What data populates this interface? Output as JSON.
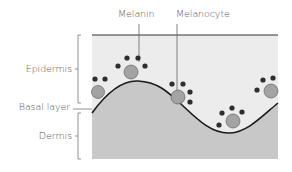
{
  "diagram": {
    "labels": {
      "melanin": "Melanin",
      "melanocyte": "Melanocyte",
      "epidermis": "Epidermis",
      "basal_layer": "Basal layer",
      "dermis": "Dermis"
    },
    "colors": {
      "epidermis_fill": "#ececec",
      "dermis_fill": "#c8c8c8",
      "melanocyte_fill": "#a3a3a3",
      "melanin_fill": "#2e2e2e",
      "line": "#1a1a1a",
      "label_text": "#555555",
      "bracket": "#777777"
    }
  }
}
